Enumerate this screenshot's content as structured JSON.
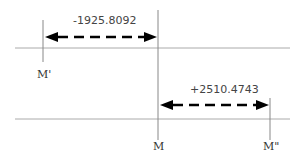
{
  "diagram": {
    "lines": {
      "top_axis": {
        "y": 48,
        "x1": 15,
        "x2": 290
      },
      "bottom_axis": {
        "y": 119,
        "x1": 15,
        "x2": 290
      }
    },
    "points": [
      {
        "id": "m-prime",
        "label": "M'",
        "x": 43
      },
      {
        "id": "m",
        "label": "M",
        "x": 158
      },
      {
        "id": "m-double-prime",
        "label": "M\"",
        "x": 270
      }
    ],
    "offsets": [
      {
        "id": "offset-negative",
        "value": "-1925.8092",
        "from": "M",
        "to": "M'"
      },
      {
        "id": "offset-positive",
        "value": "+2510.4743",
        "from": "M",
        "to": "M\""
      }
    ],
    "colors": {
      "line": "#aaaaaa",
      "arrow": "#000000",
      "text": "#333333"
    }
  }
}
